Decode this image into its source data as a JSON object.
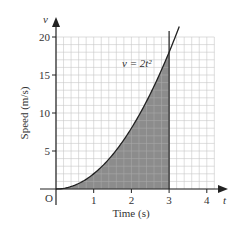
{
  "chart_data": {
    "type": "area",
    "title": "",
    "xlabel": "Time (s)",
    "ylabel": "Speed (m/s)",
    "x_axis_symbol": "t",
    "y_axis_symbol": "v",
    "origin_label": "O",
    "x_ticks": [
      "1",
      "2",
      "3",
      "4"
    ],
    "y_ticks": [
      "5",
      "10",
      "15",
      "20"
    ],
    "xlim": [
      0,
      4.2
    ],
    "ylim": [
      0,
      20
    ],
    "grid": true,
    "grid_minor_x": 0.2,
    "grid_minor_y": 1,
    "curve": {
      "equation_label": "v = 2t²",
      "function": "v = 2t^2",
      "x": [
        0,
        0.5,
        1,
        1.5,
        2,
        2.5,
        3,
        3.2
      ],
      "y": [
        0,
        0.5,
        2,
        4.5,
        8,
        12.5,
        18,
        20.48
      ]
    },
    "shaded_region": {
      "from_t": 0,
      "to_t": 3,
      "color": "#8c8c8c"
    },
    "vertical_line_at_t": 3
  },
  "colors": {
    "grid": "#c8c8c8",
    "axis": "#222222",
    "shade": "#8c8c8c",
    "curve": "#222222"
  }
}
